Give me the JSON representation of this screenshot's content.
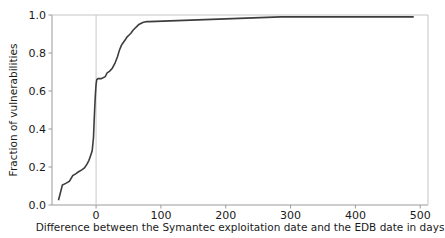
{
  "chart_data": {
    "type": "line",
    "subtype": "step-ecdf",
    "title": "",
    "xlabel": "Difference between the Symantec exploitation date and the EDB date in days",
    "ylabel": "Fraction of vulnerabilities",
    "xlim": [
      -68,
      512
    ],
    "ylim": [
      0.0,
      1.0
    ],
    "grid": false,
    "legend": null,
    "xticks": [
      0,
      100,
      200,
      300,
      400,
      500
    ],
    "xtick_labels": [
      "0",
      "100",
      "200",
      "300",
      "400",
      "500"
    ],
    "yticks": [
      0.0,
      0.2,
      0.4,
      0.6,
      0.8,
      1.0
    ],
    "ytick_labels": [
      "0.0",
      "0.2",
      "0.4",
      "0.6",
      "0.8",
      "1.0"
    ],
    "line_color": "#3d3d3d",
    "line_width": 1.6,
    "annotations": [
      {
        "name": "zero-reference-line",
        "type": "vline",
        "x": 0,
        "color": "#c8c8c8",
        "width": 1
      }
    ],
    "series": [
      {
        "name": "ECDF of exploitation-date difference",
        "x": [
          -58,
          -58,
          -52,
          -52,
          -46,
          -46,
          -41,
          -41,
          -36,
          -36,
          -31,
          -31,
          -27,
          -27,
          -22,
          -22,
          -18,
          -18,
          -14,
          -14,
          -11,
          -11,
          -8,
          -8,
          -6,
          -6,
          -4,
          -4,
          -3,
          -3,
          -2,
          -2,
          -1,
          -1,
          0,
          0,
          1,
          1,
          3,
          3,
          8,
          8,
          14,
          14,
          17,
          17,
          21,
          21,
          25,
          25,
          29,
          29,
          33,
          33,
          36,
          36,
          39,
          39,
          42,
          42,
          45,
          45,
          48,
          48,
          51,
          51,
          54,
          54,
          57,
          57,
          60,
          60,
          63,
          63,
          66,
          66,
          69,
          69,
          72,
          72,
          75,
          75,
          78,
          78,
          82,
          82,
          285,
          285,
          490
        ],
        "y": [
          0.025,
          0.025,
          0.105,
          0.105,
          0.115,
          0.115,
          0.125,
          0.125,
          0.155,
          0.155,
          0.165,
          0.165,
          0.175,
          0.175,
          0.185,
          0.185,
          0.195,
          0.195,
          0.215,
          0.215,
          0.235,
          0.235,
          0.265,
          0.265,
          0.285,
          0.285,
          0.355,
          0.355,
          0.44,
          0.44,
          0.52,
          0.52,
          0.585,
          0.585,
          0.635,
          0.635,
          0.66,
          0.66,
          0.665,
          0.665,
          0.665,
          0.665,
          0.675,
          0.675,
          0.695,
          0.695,
          0.705,
          0.705,
          0.72,
          0.72,
          0.745,
          0.745,
          0.78,
          0.78,
          0.815,
          0.815,
          0.84,
          0.84,
          0.855,
          0.855,
          0.87,
          0.87,
          0.885,
          0.885,
          0.895,
          0.895,
          0.905,
          0.905,
          0.92,
          0.92,
          0.93,
          0.93,
          0.94,
          0.94,
          0.95,
          0.95,
          0.955,
          0.955,
          0.96,
          0.96,
          0.963,
          0.963,
          0.965,
          0.965,
          0.965,
          0.965,
          0.99,
          0.99,
          0.99
        ]
      }
    ]
  }
}
